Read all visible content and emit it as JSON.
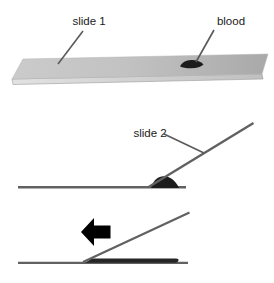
{
  "diagram": {
    "labels": {
      "slide1": "slide 1",
      "blood": "blood",
      "slide2": "slide 2"
    },
    "colors": {
      "background": "#ffffff",
      "line": "#616161",
      "leader_line": "#5a5a5a",
      "slide_face_light": "#cbcbcb",
      "slide_face_dark": "#a9a9a9",
      "slide_edge_light": "#dedede",
      "slide_edge_border": "#9a9a9a",
      "blood_drop": "#1c1c1c",
      "blood_smear": "#262626",
      "arrow": "#000000"
    }
  }
}
